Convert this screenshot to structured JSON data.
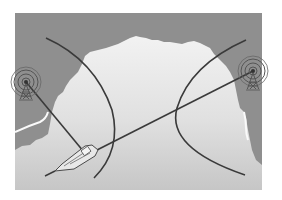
{
  "diagram": {
    "type": "illustration",
    "panel": {
      "x": 15,
      "y": 13,
      "width": 247,
      "height": 177
    },
    "colors": {
      "background": "#ffffff",
      "sea": "#8f8f8f",
      "land_top": "#f0f0f0",
      "land_bottom": "#c9c9c9",
      "line": "#3a3a3a",
      "tower": "#555555",
      "boat": "#e6e6e6"
    },
    "elements": [
      {
        "id": "left-tower",
        "kind": "radio-tower",
        "x": 26,
        "y": 82,
        "rings": 3
      },
      {
        "id": "right-tower",
        "kind": "radio-tower",
        "x": 253,
        "y": 71,
        "rings": 3
      },
      {
        "id": "boat",
        "kind": "ship",
        "x": 80,
        "y": 160
      },
      {
        "id": "left-hyperbola",
        "kind": "line-of-position"
      },
      {
        "id": "right-hyperbola",
        "kind": "line-of-position"
      },
      {
        "id": "left-signal-line",
        "kind": "bearing-line",
        "from": "left-tower",
        "to": "boat"
      },
      {
        "id": "right-signal-line",
        "kind": "bearing-line",
        "from": "right-tower",
        "to": "boat"
      }
    ]
  }
}
